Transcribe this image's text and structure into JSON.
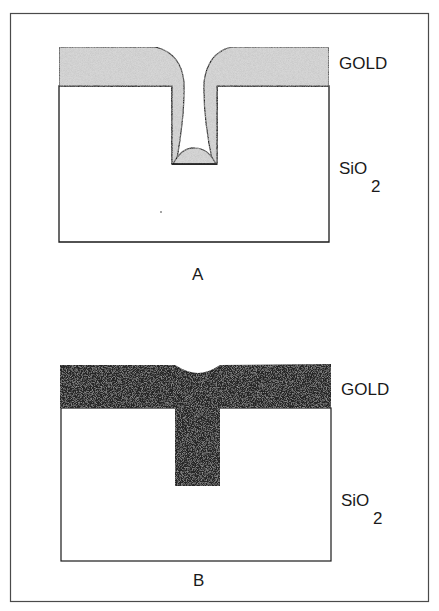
{
  "figure": {
    "frame_color": "#555555",
    "panels": [
      {
        "id": "A",
        "caption": "A",
        "description": "Conformal gold deposition over a trench in SiO2 leaving a void/keyhole",
        "layers": {
          "gold": {
            "label": "GOLD",
            "fill": "#d6d6d6"
          },
          "oxide": {
            "label_main": "SiO",
            "label_sub": "2",
            "fill": "#ffffff"
          }
        }
      },
      {
        "id": "B",
        "caption": "B",
        "description": "Gold fully fills the trench forming a T-shaped plug with a small surface dimple",
        "layers": {
          "gold": {
            "label": "GOLD",
            "fill": "#262626"
          },
          "oxide": {
            "label_main": "SiO",
            "label_sub": "2",
            "fill": "#ffffff"
          }
        }
      }
    ]
  }
}
